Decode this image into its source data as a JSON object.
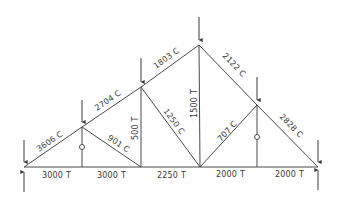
{
  "diagram": {
    "type": "truss-force-diagram",
    "nodes": {
      "L0": [
        24,
        167
      ],
      "U1": [
        82,
        127
      ],
      "U2": [
        141,
        87
      ],
      "U3": [
        199,
        45
      ],
      "U4": [
        257,
        105
      ],
      "L5": [
        318,
        167
      ],
      "B1": [
        82,
        167
      ],
      "B2": [
        141,
        167
      ],
      "B3": [
        200,
        167
      ],
      "B4": [
        257,
        167
      ]
    },
    "members": [
      {
        "id": "top-1",
        "from": "L0",
        "to": "U1",
        "label": "3606 C"
      },
      {
        "id": "top-2",
        "from": "U1",
        "to": "U2",
        "label": "2704 C"
      },
      {
        "id": "top-3",
        "from": "U2",
        "to": "U3",
        "label": "1803 C"
      },
      {
        "id": "top-4",
        "from": "U3",
        "to": "U4",
        "label": "2122 C"
      },
      {
        "id": "top-5",
        "from": "U4",
        "to": "L5",
        "label": "2828 C"
      },
      {
        "id": "bot-1",
        "from": "L0",
        "to": "B1",
        "label": "3000 T"
      },
      {
        "id": "bot-2",
        "from": "B1",
        "to": "B2",
        "label": "3000 T"
      },
      {
        "id": "bot-3",
        "from": "B2",
        "to": "B3",
        "label": "2250 T"
      },
      {
        "id": "bot-4",
        "from": "B3",
        "to": "B4",
        "label": "2000 T"
      },
      {
        "id": "bot-5",
        "from": "B4",
        "to": "L5",
        "label": "2000 T"
      },
      {
        "id": "vert-1",
        "from": "U1",
        "to": "B1",
        "label": "0"
      },
      {
        "id": "diag-1",
        "from": "U1",
        "to": "B2",
        "label": "901 C"
      },
      {
        "id": "vert-2",
        "from": "U2",
        "to": "B2",
        "label": "500 T"
      },
      {
        "id": "diag-2",
        "from": "U2",
        "to": "B3",
        "label": "1250 C"
      },
      {
        "id": "vert-3",
        "from": "U3",
        "to": "B3",
        "label": "1500 T"
      },
      {
        "id": "diag-3",
        "from": "B3",
        "to": "U4",
        "label": "707 C"
      },
      {
        "id": "vert-4",
        "from": "U4",
        "to": "B4",
        "label": "0"
      }
    ],
    "loads": [
      {
        "node": "L0",
        "direction": "down"
      },
      {
        "node": "U1",
        "direction": "down"
      },
      {
        "node": "U2",
        "direction": "down"
      },
      {
        "node": "U3",
        "direction": "down"
      },
      {
        "node": "U4",
        "direction": "down"
      },
      {
        "node": "L5",
        "direction": "down"
      }
    ],
    "reactions": [
      {
        "node": "L0",
        "direction": "up"
      },
      {
        "node": "L5",
        "direction": "up"
      }
    ],
    "labels": {
      "top1": "3606 C",
      "top2": "2704 C",
      "top3": "1803 C",
      "top4": "2122 C",
      "top5": "2828 C",
      "bot1": "3000 T",
      "bot2": "3000 T",
      "bot3": "2250 T",
      "bot4": "2000 T",
      "bot5": "2000 T",
      "diag1": "901 C",
      "vert2": "500 T",
      "diag2": "1250 C",
      "vert3": "1500 T",
      "diag3": "707 C"
    },
    "colors": {
      "line": "#4a4a4a",
      "text": "#3a3a3a",
      "background": "#ffffff"
    }
  }
}
